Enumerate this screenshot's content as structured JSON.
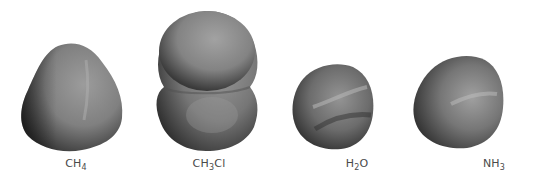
{
  "figure": {
    "background": "#ffffff",
    "surface_colors": {
      "light": "#9a9a9a",
      "mid": "#7a7a7a",
      "dark": "#3c3c3c",
      "highlight": "#b8b8b8"
    },
    "molecules": [
      {
        "id": "ch4",
        "formula_main": "CH",
        "sub1": "4",
        "tail": "",
        "center_x": 76
      },
      {
        "id": "ch3cl",
        "formula_main": "CH",
        "sub1": "3",
        "tail": "Cl",
        "center_x": 209
      },
      {
        "id": "h2o",
        "formula_main": "H",
        "sub1": "2",
        "tail": "O",
        "center_x": 357
      },
      {
        "id": "nh3",
        "formula_main": "NH",
        "sub1": "3",
        "tail": "",
        "center_x": 494
      }
    ]
  }
}
